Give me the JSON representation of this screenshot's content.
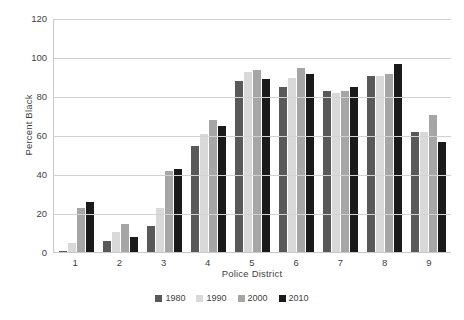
{
  "chart_data": {
    "type": "bar",
    "title": "",
    "subtitle": "",
    "xlabel": "Police District",
    "ylabel": "Percent Black",
    "categories": [
      "1",
      "2",
      "3",
      "4",
      "5",
      "6",
      "7",
      "8",
      "9"
    ],
    "series": [
      {
        "name": "1980",
        "color": "#595959",
        "values": [
          1,
          6,
          14,
          55,
          88,
          85,
          83,
          91,
          62
        ]
      },
      {
        "name": "1990",
        "color": "#d9d9d9",
        "values": [
          5,
          11,
          23,
          61,
          93,
          90,
          82,
          91,
          62
        ]
      },
      {
        "name": "2000",
        "color": "#a6a6a6",
        "values": [
          23,
          15,
          42,
          68,
          94,
          95,
          83,
          92,
          71
        ]
      },
      {
        "name": "2010",
        "color": "#1a1a1a",
        "values": [
          26,
          8,
          43,
          65,
          89,
          92,
          85,
          97,
          57
        ]
      }
    ],
    "ylim": [
      0,
      120
    ],
    "yticks": [
      0,
      20,
      40,
      60,
      80,
      100,
      120
    ],
    "ytick_labels": [
      "0",
      "20",
      "40",
      "60",
      "80",
      "100",
      "120"
    ],
    "grid": true,
    "grid_axis": "y",
    "legend_position": "bottom",
    "legend_entries": [
      "1980",
      "1990",
      "2000",
      "2010"
    ]
  }
}
